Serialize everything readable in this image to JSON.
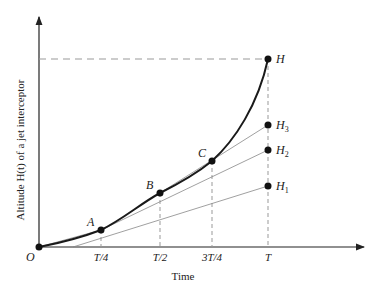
{
  "figure": {
    "y_axis_label": "Altitude H(t) of a jet interceptor",
    "x_axis_label": "Time",
    "origin_label": "O",
    "x_ticks": [
      "T/4",
      "T/2",
      "3T/4",
      "T"
    ],
    "points": {
      "A": "A",
      "B": "B",
      "C": "C",
      "H": "H",
      "H1": "H",
      "H1_sub": "1",
      "H2": "H",
      "H2_sub": "2",
      "H3": "H",
      "H3_sub": "3"
    },
    "colors": {
      "curve": "#1a1a1a",
      "tangent": "#888888",
      "dashed": "#999999",
      "axis": "#222222"
    }
  }
}
